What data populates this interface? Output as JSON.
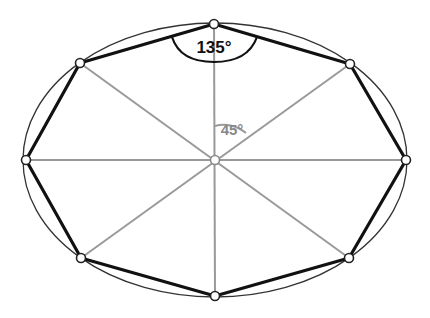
{
  "diagram": {
    "center": {
      "x": 215,
      "y": 160
    },
    "ellipse": {
      "rx": 192,
      "ry": 137,
      "stroke": "#333333"
    },
    "vertices": [
      {
        "name": "top",
        "x": 214,
        "y": 24
      },
      {
        "name": "top-right",
        "x": 350,
        "y": 64
      },
      {
        "name": "right",
        "x": 406,
        "y": 160
      },
      {
        "name": "bottom-right",
        "x": 349,
        "y": 258
      },
      {
        "name": "bottom",
        "x": 215,
        "y": 296
      },
      {
        "name": "bottom-left",
        "x": 81,
        "y": 258
      },
      {
        "name": "left",
        "x": 26,
        "y": 160
      },
      {
        "name": "top-left",
        "x": 80,
        "y": 63
      }
    ],
    "colors": {
      "edge": "#111111",
      "spoke": "#999999",
      "interior_label": "#888888",
      "exterior_label": "#111111"
    },
    "labels": {
      "interior_angle": "135°",
      "central_angle": "45°"
    }
  }
}
